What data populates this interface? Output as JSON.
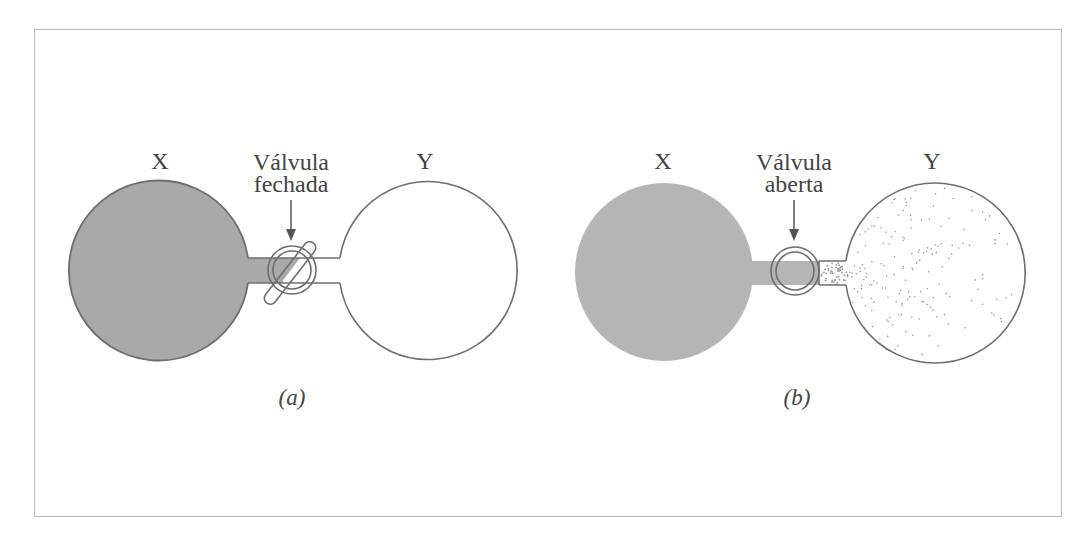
{
  "figure": {
    "frame": {
      "x": 34,
      "y": 29,
      "width": 1028,
      "height": 488,
      "stroke": "#bdbdbd"
    },
    "colors": {
      "gas_fill_closed": "#a9a9a9",
      "gas_fill_open": "#b5b5b5",
      "outline": "#6e6e6e",
      "stipple": "#9a9a9a",
      "text": "#444444"
    },
    "panels": [
      {
        "id": "a",
        "caption": "(a)",
        "left_bulb_label": "X",
        "right_bulb_label": "Y",
        "valve_label_line1": "Válvula",
        "valve_label_line2": "fechada",
        "valve_state": "closed",
        "left_bulb": {
          "cx": 160,
          "cy": 271,
          "r": 90,
          "filled": true,
          "outlined": true
        },
        "right_bulb": {
          "cx": 427,
          "cy": 271,
          "r": 89,
          "filled": false,
          "outlined": true
        },
        "valve": {
          "cx": 292,
          "cy": 270,
          "r_outer": 24,
          "r_inner": 19
        }
      },
      {
        "id": "b",
        "caption": "(b)",
        "left_bulb_label": "X",
        "right_bulb_label": "Y",
        "valve_label_line1": "Válvula",
        "valve_label_line2": "aberta",
        "valve_state": "open",
        "left_bulb": {
          "cx": 664,
          "cy": 272,
          "r": 89,
          "filled": true,
          "outlined": false
        },
        "right_bulb": {
          "cx": 933,
          "cy": 273,
          "r": 90,
          "filled": false,
          "outlined": true,
          "stippled": true
        },
        "valve": {
          "cx": 795,
          "cy": 271,
          "r_outer": 24,
          "r_inner": 19
        }
      }
    ]
  }
}
